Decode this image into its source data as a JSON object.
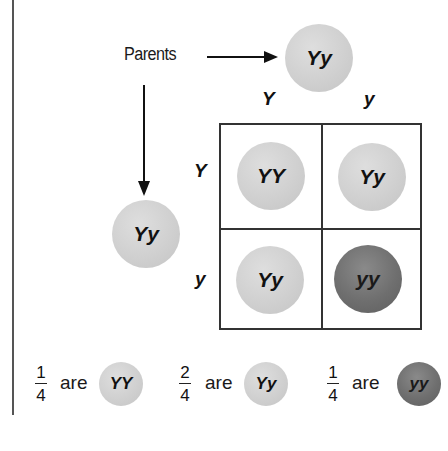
{
  "diagram": {
    "type": "punnett-square",
    "parents_label": "Parents",
    "parent_top": {
      "genotype": "Yy",
      "color": "#d0d0d0"
    },
    "parent_left": {
      "genotype": "Yy",
      "color": "#d0d0d0"
    },
    "column_alleles": [
      "Y",
      "y"
    ],
    "row_alleles": [
      "Y",
      "y"
    ],
    "cells": [
      {
        "row": 0,
        "col": 0,
        "genotype": "YY",
        "shade": "light"
      },
      {
        "row": 0,
        "col": 1,
        "genotype": "Yy",
        "shade": "light"
      },
      {
        "row": 1,
        "col": 0,
        "genotype": "Yy",
        "shade": "light"
      },
      {
        "row": 1,
        "col": 1,
        "genotype": "yy",
        "shade": "dark"
      }
    ],
    "colors": {
      "light": "#d0d0d0",
      "dark": "#6f6f6f",
      "grid": "#333333"
    },
    "summary": [
      {
        "numerator": "1",
        "denominator": "4",
        "word": "are",
        "genotype": "YY",
        "shade": "light"
      },
      {
        "numerator": "2",
        "denominator": "4",
        "word": "are",
        "genotype": "Yy",
        "shade": "light"
      },
      {
        "numerator": "1",
        "denominator": "4",
        "word": "are",
        "genotype": "yy",
        "shade": "dark"
      }
    ]
  }
}
